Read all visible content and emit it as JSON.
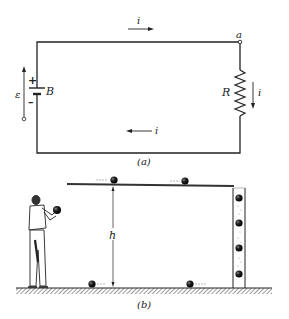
{
  "figure_a": {
    "caption": "(a)",
    "current_top": "i",
    "current_right": "i",
    "current_bottom": "i",
    "node_label": "a",
    "resistor_label": "R",
    "battery_label": "B",
    "emf_label": "ε",
    "plus_sign": "+",
    "minus_sign": "–"
  },
  "figure_b": {
    "caption": "(b)",
    "height_label": "h"
  },
  "colors": {
    "ink": "#222222",
    "ground_hatch": "#555555",
    "background": "#ffffff"
  }
}
